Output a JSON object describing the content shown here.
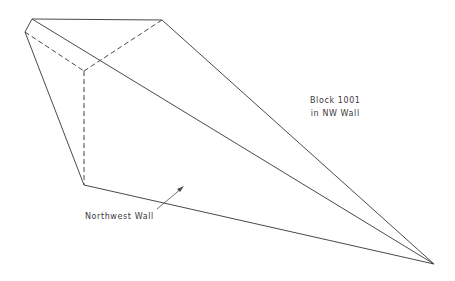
{
  "diagram": {
    "line_color": "#4a4a4a",
    "labels": {
      "block": [
        "Block 1001",
        "in NW Wall"
      ],
      "northwest_wall": "Northwest Wall"
    },
    "vertices": {
      "A": [
        32,
        19
      ],
      "B": [
        25,
        32
      ],
      "C": [
        162,
        20
      ],
      "D": [
        84,
        71
      ],
      "E": [
        84,
        185
      ],
      "F": [
        434,
        264
      ]
    },
    "solid_edges": [
      [
        "A",
        "C"
      ],
      [
        "A",
        "B"
      ],
      [
        "B",
        "E"
      ],
      [
        "E",
        "F"
      ],
      [
        "C",
        "F"
      ],
      [
        "A",
        "F"
      ]
    ],
    "dashed_edges": [
      [
        "B",
        "D"
      ],
      [
        "D",
        "C"
      ],
      [
        "D",
        "E"
      ]
    ],
    "arrow": {
      "from": [
        157,
        209
      ],
      "to": [
        184,
        186
      ]
    }
  }
}
